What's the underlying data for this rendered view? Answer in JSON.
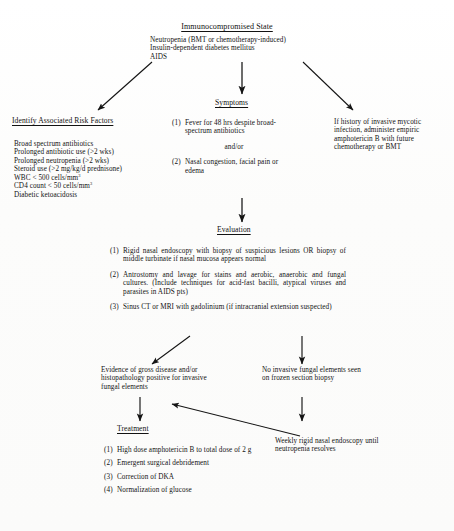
{
  "doc": {
    "kind": "clinical-algorithm-flowchart",
    "ink_color": "#121212",
    "paper_color": "#fdfdfd"
  },
  "top": {
    "title": "Immunocompromised State",
    "conditions": [
      "Neutropenia (BMT or chemotherapy-induced)",
      "Insulin-dependent diabetes mellitus",
      "AIDS"
    ]
  },
  "risk_factors": {
    "heading": "Identify Associated Risk Factors",
    "items_pre": [
      "Broad spectrum antibiotics",
      "Prolonged antibiotic use (>2 wks)",
      "Prolonged neutropenia (>2 wks)",
      "Steroid use (>2 mg/kg/d prednisone)"
    ],
    "wbc_label": "WBC < 500 cells/mm",
    "wbc_sup": "3",
    "cd4_label": "CD4 count < 50 cells/mm",
    "cd4_sup": "3",
    "items_post": [
      "Diabetic ketoacidosis"
    ]
  },
  "symptoms": {
    "heading": "Symptoms",
    "item1_num": "(1)",
    "item1_text": "Fever for 48 hrs despite broad-spectrum antibiotics",
    "connector": "and/or",
    "item2_num": "(2)",
    "item2_text": "Nasal congestion, facial pain or edema"
  },
  "mycotic_history": {
    "text": "If history of invasive mycotic infection, administer empiric amphotericin B with future chemotherapy or BMT"
  },
  "evaluation": {
    "heading": "Evaluation",
    "items": [
      {
        "num": "(1)",
        "text": "Rigid nasal endoscopy with biopsy of suspicious lesions OR biopsy of middle turbinate if nasal mucosa appears normal"
      },
      {
        "num": "(2)",
        "text": "Antrostomy and lavage for stains and aerobic, anaerobic and fungal cultures.  (Include techniques for acid-fast bacilli, atypical viruses and parasites in AIDS pts)"
      },
      {
        "num": "(3)",
        "text": "Sinus CT or MRI with gadolinium (if intracranial extension suspected)"
      }
    ]
  },
  "outcome_positive": {
    "text": "Evidence of gross disease and/or histopathology positive for invasive fungal elements"
  },
  "outcome_negative": {
    "text": "No invasive fungal elements seen on frozen section biopsy"
  },
  "treatment": {
    "heading": "Treatment",
    "items": [
      {
        "num": "(1)",
        "text": "High dose amphotericin B to total dose of 2 g"
      },
      {
        "num": "(2)",
        "text": "Emergent surgical debridement"
      },
      {
        "num": "(3)",
        "text": "Correction of DKA"
      },
      {
        "num": "(4)",
        "text": "Normalization of glucose"
      }
    ]
  },
  "surveillance": {
    "text": "Weekly rigid nasal endoscopy until neutropenia resolves"
  }
}
